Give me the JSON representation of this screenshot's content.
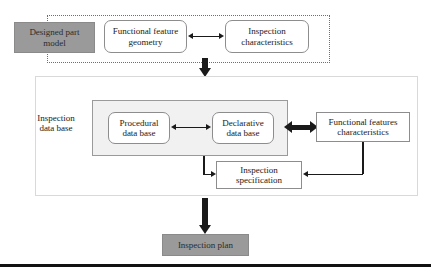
{
  "diagram": {
    "colors": {
      "filled_box_bg": "#9a9a9a",
      "inner_panel_bg": "#f1f1f1",
      "box_border": "#8d8d8d",
      "panel_border": "#d9d9d9",
      "dotted_border": "#6f6f6f",
      "connector": "#1a1a1a",
      "text": "#1a1a1a",
      "page_bg": "#ffffff"
    },
    "top_section": {
      "designed_part_model": "Designed part\nmodel",
      "functional_feature_geometry": "Functional feature\ngeometry",
      "inspection_characteristics": "Inspection\ncharacteristics"
    },
    "middle_section": {
      "inspection_data_base_label": "Inspection\ndata base",
      "procedural_data_base": "Procedural\ndata base",
      "declarative_data_base": "Declarative\ndata base",
      "functional_features_characteristics": "Functional features\ncharacteristics",
      "inspection_specification": "Inspection\nspecification"
    },
    "bottom_section": {
      "inspection_plan": "Inspection plan"
    },
    "connectors": [
      {
        "name": "geometry-to-characteristics",
        "kind": "bidirectional-horizontal"
      },
      {
        "name": "top-to-database",
        "kind": "down-thick"
      },
      {
        "name": "procedural-to-declarative",
        "kind": "bidirectional-horizontal"
      },
      {
        "name": "declarative-to-functional-features",
        "kind": "bidirectional-horizontal-bold"
      },
      {
        "name": "database-to-specification",
        "kind": "elbow-down-right"
      },
      {
        "name": "functional-features-to-specification",
        "kind": "elbow-down-left"
      },
      {
        "name": "database-to-inspection-plan",
        "kind": "down-thick"
      }
    ]
  }
}
